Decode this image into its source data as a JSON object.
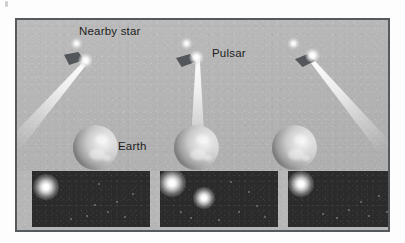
{
  "figure": {
    "kind": "astronomy-illustration",
    "background_color": "#b7b7b7",
    "frame_color": "#555a5c",
    "panel_color": "#2b2b2b"
  },
  "labels": {
    "nearby_star": "Nearby star",
    "pulsar": "Pulsar",
    "earth": "Earth"
  },
  "scenes": [
    {
      "id": "scene-left",
      "beam_direction": "down-left",
      "beam_hits_earth": false,
      "has_nearby_star": true,
      "has_pulsar": true,
      "has_earth": true
    },
    {
      "id": "scene-middle",
      "beam_direction": "down",
      "beam_hits_earth": true,
      "has_nearby_star": true,
      "has_pulsar": true,
      "has_earth": true
    },
    {
      "id": "scene-right",
      "beam_direction": "down-right",
      "beam_hits_earth": false,
      "has_nearby_star": true,
      "has_pulsar": true,
      "has_earth": true
    }
  ],
  "observation_panels": [
    {
      "id": "panel-1",
      "bright_star_count": 1,
      "pulsar_visible": false,
      "bright_stars": [
        {
          "x": 14,
          "y": 16,
          "size": 26
        }
      ],
      "faint_stars": [
        {
          "x": 54,
          "y": 44,
          "size": 2
        },
        {
          "x": 62,
          "y": 33,
          "size": 2
        },
        {
          "x": 75,
          "y": 40,
          "size": 2
        },
        {
          "x": 84,
          "y": 30,
          "size": 2
        },
        {
          "x": 92,
          "y": 45,
          "size": 2
        },
        {
          "x": 38,
          "y": 47,
          "size": 2
        },
        {
          "x": 100,
          "y": 22,
          "size": 2
        },
        {
          "x": 66,
          "y": 12,
          "size": 2
        }
      ]
    },
    {
      "id": "panel-2",
      "bright_star_count": 2,
      "pulsar_visible": true,
      "bright_stars": [
        {
          "x": 12,
          "y": 12,
          "size": 28
        },
        {
          "x": 44,
          "y": 27,
          "size": 22
        }
      ],
      "faint_stars": [
        {
          "x": 78,
          "y": 40,
          "size": 2
        },
        {
          "x": 88,
          "y": 20,
          "size": 2
        },
        {
          "x": 96,
          "y": 34,
          "size": 2
        },
        {
          "x": 70,
          "y": 10,
          "size": 2
        },
        {
          "x": 30,
          "y": 46,
          "size": 2
        },
        {
          "x": 58,
          "y": 48,
          "size": 2
        },
        {
          "x": 104,
          "y": 45,
          "size": 2
        },
        {
          "x": 20,
          "y": 40,
          "size": 2
        }
      ]
    },
    {
      "id": "panel-3",
      "bright_star_count": 1,
      "pulsar_visible": false,
      "bright_stars": [
        {
          "x": 13,
          "y": 13,
          "size": 26
        }
      ],
      "faint_stars": [
        {
          "x": 60,
          "y": 38,
          "size": 2
        },
        {
          "x": 72,
          "y": 30,
          "size": 2
        },
        {
          "x": 80,
          "y": 44,
          "size": 2
        },
        {
          "x": 90,
          "y": 24,
          "size": 2
        },
        {
          "x": 98,
          "y": 40,
          "size": 2
        },
        {
          "x": 48,
          "y": 46,
          "size": 2
        },
        {
          "x": 104,
          "y": 14,
          "size": 2
        },
        {
          "x": 34,
          "y": 42,
          "size": 2
        }
      ]
    }
  ]
}
